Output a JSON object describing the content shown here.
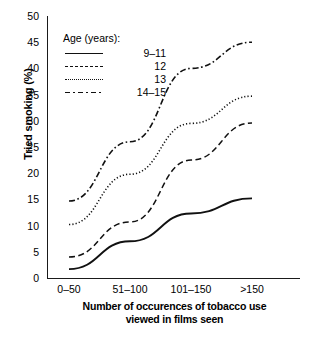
{
  "chart_data": {
    "type": "line",
    "title": "",
    "xlabel": "Number of occurences of tobacco use viewed in films seen",
    "xlabel_line1": "Number of occurences of tobacco use",
    "xlabel_line2": "viewed in films seen",
    "ylabel": "Tried smoking (%)",
    "categories": [
      "0–50",
      "51–100",
      "101–150",
      ">150"
    ],
    "ylim": [
      0,
      50
    ],
    "ytick_labels": [
      "0",
      "5",
      "10",
      "15",
      "20",
      "25",
      "30",
      "35",
      "40",
      "45",
      "50"
    ],
    "yticks": [
      0,
      5,
      10,
      15,
      20,
      25,
      30,
      35,
      40,
      45,
      50
    ],
    "grid": false,
    "legend_position": "upper-left",
    "legend_title": "Age (years):",
    "series": [
      {
        "name": "9–11",
        "style": "solid",
        "values": [
          1.7,
          7.0,
          12.3,
          15.2
        ]
      },
      {
        "name": "12",
        "style": "dashed",
        "values": [
          4.0,
          10.7,
          22.5,
          29.6
        ]
      },
      {
        "name": "13",
        "style": "dotted",
        "values": [
          10.2,
          19.8,
          29.5,
          34.7
        ]
      },
      {
        "name": "14–15",
        "style": "dashdot",
        "values": [
          14.7,
          26.0,
          40.0,
          45.0
        ]
      }
    ],
    "line_color": "#111111"
  },
  "legend": {
    "title": "Age (years):",
    "entries": [
      {
        "label": "9–11",
        "style": "solid"
      },
      {
        "label": "12",
        "style": "dashed"
      },
      {
        "label": "13",
        "style": "dotted"
      },
      {
        "label": "14–15",
        "style": "dashdot"
      }
    ]
  }
}
